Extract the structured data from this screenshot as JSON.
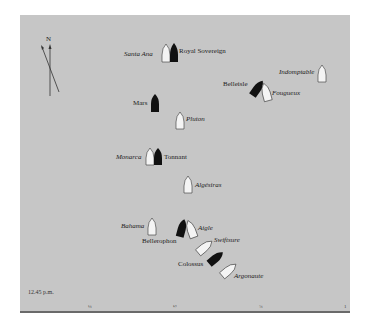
{
  "map": {
    "time_label": "12.45 p.m.",
    "compass": {
      "label": "N"
    },
    "scale_ticks": [
      "¼",
      "½",
      "¾",
      "1"
    ],
    "ships": [
      {
        "name": "Santa Ana",
        "fleet": "franco-spanish",
        "fill": "#f4f4f4"
      },
      {
        "name": "Royal Sovereign",
        "fleet": "british",
        "fill": "#111111"
      },
      {
        "name": "Indomptable",
        "fleet": "franco-spanish",
        "fill": "#f4f4f4"
      },
      {
        "name": "Belleisle",
        "fleet": "british",
        "fill": "#111111"
      },
      {
        "name": "Fougueux",
        "fleet": "franco-spanish",
        "fill": "#f4f4f4"
      },
      {
        "name": "Mars",
        "fleet": "british",
        "fill": "#111111"
      },
      {
        "name": "Pluton",
        "fleet": "franco-spanish",
        "fill": "#f4f4f4"
      },
      {
        "name": "Monarca",
        "fleet": "franco-spanish",
        "fill": "#f4f4f4"
      },
      {
        "name": "Tonnant",
        "fleet": "british",
        "fill": "#111111"
      },
      {
        "name": "Algésiras",
        "fleet": "franco-spanish",
        "fill": "#f4f4f4"
      },
      {
        "name": "Bahama",
        "fleet": "franco-spanish",
        "fill": "#f4f4f4"
      },
      {
        "name": "Aigle",
        "fleet": "franco-spanish",
        "fill": "#f4f4f4"
      },
      {
        "name": "Bellerophon",
        "fleet": "british",
        "fill": "#111111"
      },
      {
        "name": "Swiftsure",
        "fleet": "franco-spanish",
        "fill": "#f4f4f4"
      },
      {
        "name": "Colossus",
        "fleet": "british",
        "fill": "#111111"
      },
      {
        "name": "Argonaute",
        "fleet": "franco-spanish",
        "fill": "#f4f4f4"
      }
    ]
  }
}
